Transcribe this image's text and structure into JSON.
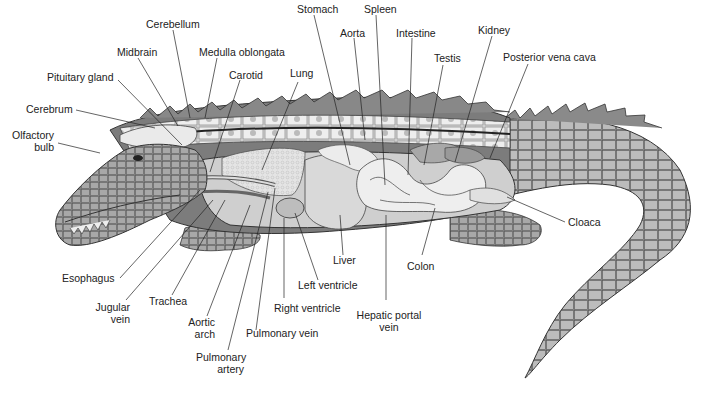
{
  "diagram": {
    "labels": {
      "cerebellum": "Cerebellum",
      "midbrain": "Midbrain",
      "medulla": "Medulla oblongata",
      "pituitary": "Pituitary gland",
      "carotid": "Carotid",
      "cerebrum": "Cerebrum",
      "olfactory_1": "Olfactory",
      "olfactory_2": "bulb",
      "stomach": "Stomach",
      "spleen": "Spleen",
      "aorta": "Aorta",
      "intestine": "Intestine",
      "lung": "Lung",
      "testis": "Testis",
      "kidney": "Kidney",
      "posterior_vena_cava": "Posterior vena cava",
      "cloaca": "Cloaca",
      "esophagus": "Esophagus",
      "jugular_1": "Jugular",
      "jugular_2": "vein",
      "trachea": "Trachea",
      "aortic_arch_1": "Aortic",
      "aortic_arch_2": "arch",
      "pulmonary_artery_1": "Pulmonary",
      "pulmonary_artery_2": "artery",
      "pulmonary_vein": "Pulmonary vein",
      "right_ventricle": "Right ventricle",
      "left_ventricle": "Left ventricle",
      "liver": "Liver",
      "hepatic_portal_1": "Hepatic portal",
      "hepatic_portal_2": "vein",
      "colon": "Colon"
    },
    "colors": {
      "outline": "#333333",
      "skin_dark": "#6e6e6e",
      "skin_mid": "#9a9a9a",
      "skin_light": "#c8c8c8",
      "organ_light": "#e6e6e6",
      "leader_line": "#222222"
    }
  }
}
